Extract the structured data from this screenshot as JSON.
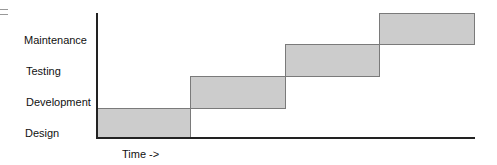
{
  "diagram": {
    "type": "waterfall-gantt",
    "corner_icon": "menu-icon",
    "phases": [
      {
        "label": "Design",
        "order": 1
      },
      {
        "label": "Development",
        "order": 2
      },
      {
        "label": "Testing",
        "order": 3
      },
      {
        "label": "Maintenance",
        "order": 4
      }
    ],
    "xlabel": "Time ->",
    "colors": {
      "bar_fill": "#cccccc",
      "bar_border": "#7a7a7a",
      "axis": "#222222"
    }
  }
}
